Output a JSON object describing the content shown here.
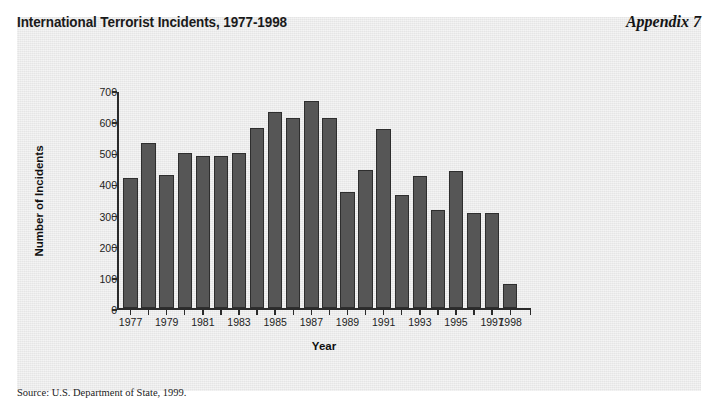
{
  "title": "International Terrorist Incidents, 1977-1998",
  "appendix_label": "Appendix 7",
  "source_note": "Source: U.S. Department of State, 1999.",
  "colors": {
    "panel_background": "#ebebeb",
    "page_background": "#ffffff",
    "bar_fill": "#565656",
    "bar_outline": "#2e2e2e",
    "axis": "#2b2b2b",
    "text": "#1a1a1a"
  },
  "chart_data": {
    "type": "bar",
    "title": "International Terrorist Incidents, 1977-1998",
    "xlabel": "Year",
    "ylabel": "Number of Incidents",
    "ylim": [
      0,
      700
    ],
    "ytick_values": [
      0,
      100,
      200,
      300,
      400,
      500,
      600,
      700
    ],
    "ytick_labels": [
      "0",
      "100",
      "200",
      "300",
      "400",
      "500",
      "600",
      "700"
    ],
    "grid": false,
    "legend": "none",
    "categories": [
      "1977",
      "1978",
      "1979",
      "1980",
      "1981",
      "1982",
      "1983",
      "1984",
      "1985",
      "1986",
      "1987",
      "1988",
      "1989",
      "1990",
      "1991",
      "1992",
      "1993",
      "1994",
      "1995",
      "1996",
      "1997",
      "1998"
    ],
    "values": [
      420,
      530,
      430,
      500,
      490,
      490,
      500,
      580,
      630,
      610,
      665,
      610,
      375,
      445,
      575,
      365,
      425,
      315,
      440,
      305,
      305,
      80
    ],
    "xtick_labels": [
      "1977",
      "1979",
      "1981",
      "1983",
      "1985",
      "1987",
      "1989",
      "1991",
      "1993",
      "1995",
      "1997",
      "1998"
    ],
    "xtick_label_categories": [
      "1977",
      "1979",
      "1981",
      "1983",
      "1985",
      "1987",
      "1989",
      "1991",
      "1993",
      "1995",
      "1997",
      "1998"
    ]
  }
}
